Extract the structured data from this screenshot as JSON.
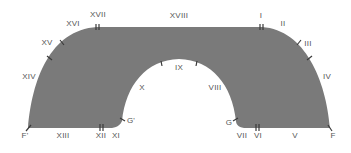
{
  "diagram": {
    "fill_color": "#7a7a7a",
    "tick_color": "#3a3a3a",
    "label_color": "#555555",
    "segment_labels": [
      {
        "id": "I",
        "text": "I",
        "x": 261,
        "y": 16
      },
      {
        "id": "II",
        "text": "II",
        "x": 283,
        "y": 24
      },
      {
        "id": "III",
        "text": "III",
        "x": 308,
        "y": 44
      },
      {
        "id": "IV",
        "text": "IV",
        "x": 327,
        "y": 77
      },
      {
        "id": "V",
        "text": "V",
        "x": 295,
        "y": 136
      },
      {
        "id": "VI",
        "text": "VI",
        "x": 258,
        "y": 136
      },
      {
        "id": "VII",
        "text": "VII",
        "x": 242,
        "y": 136
      },
      {
        "id": "VIII",
        "text": "VIII",
        "x": 215,
        "y": 88
      },
      {
        "id": "IX",
        "text": "IX",
        "x": 179,
        "y": 68
      },
      {
        "id": "X",
        "text": "X",
        "x": 142,
        "y": 88
      },
      {
        "id": "XI",
        "text": "XI",
        "x": 116,
        "y": 136
      },
      {
        "id": "XII",
        "text": "XII",
        "x": 101,
        "y": 136
      },
      {
        "id": "XIII",
        "text": "XIII",
        "x": 63,
        "y": 136
      },
      {
        "id": "XIV",
        "text": "XIV",
        "x": 29,
        "y": 77
      },
      {
        "id": "XV",
        "text": "XV",
        "x": 47,
        "y": 43
      },
      {
        "id": "XVI",
        "text": "XVI",
        "x": 73,
        "y": 24
      },
      {
        "id": "XVII",
        "text": "XVII",
        "x": 98,
        "y": 15
      },
      {
        "id": "XVIII",
        "text": "XVIII",
        "x": 179,
        "y": 16
      }
    ],
    "point_labels": [
      {
        "id": "F",
        "text": "F",
        "x": 333,
        "y": 136
      },
      {
        "id": "F_prime",
        "text": "F'",
        "x": 25,
        "y": 136
      },
      {
        "id": "G",
        "text": "G",
        "x": 229,
        "y": 123
      },
      {
        "id": "G_prime",
        "text": "G'",
        "x": 131,
        "y": 121
      }
    ]
  }
}
